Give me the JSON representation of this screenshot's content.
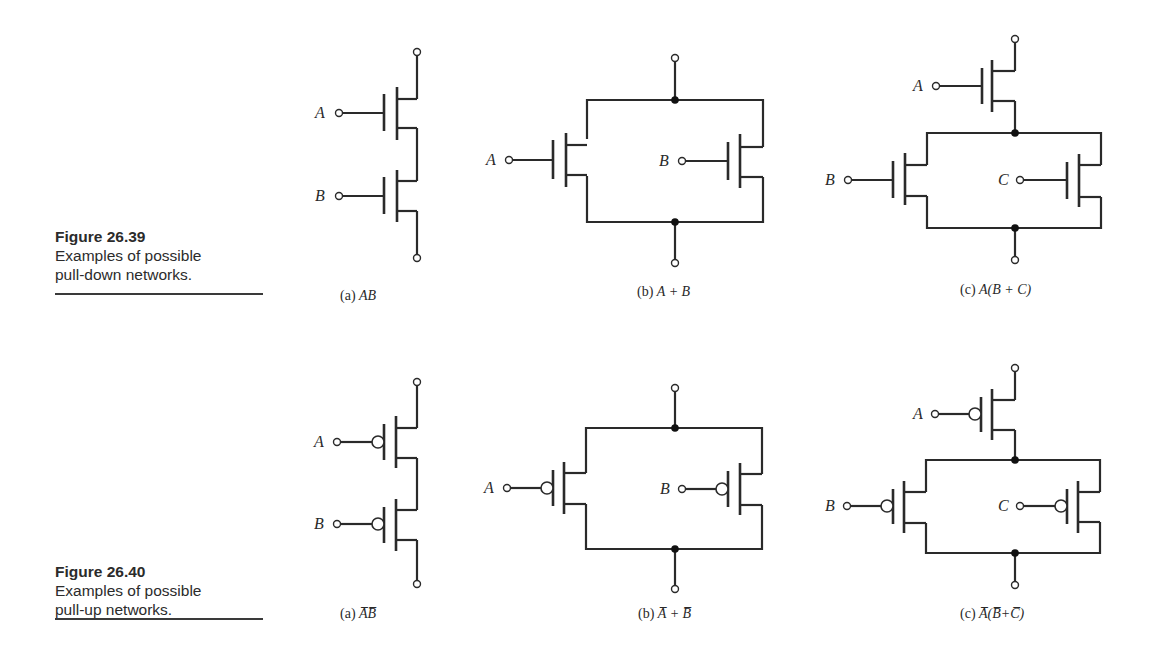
{
  "figures": [
    {
      "number": "Figure 26.39",
      "description_line1": "Examples of possible",
      "description_line2": "pull-down networks.",
      "transistor_type": "NMOS",
      "circuits": [
        {
          "id": "a",
          "prefix": "(a)",
          "expression": "AB",
          "inputs": [
            "A",
            "B"
          ],
          "topology": "series"
        },
        {
          "id": "b",
          "prefix": "(b)",
          "expression": "A + B",
          "inputs": [
            "A",
            "B"
          ],
          "topology": "parallel"
        },
        {
          "id": "c",
          "prefix": "(c)",
          "expression": "A(B + C)",
          "inputs": [
            "A",
            "B",
            "C"
          ],
          "topology": "series-parallel"
        }
      ]
    },
    {
      "number": "Figure 26.40",
      "description_line1": "Examples of possible",
      "description_line2": "pull-up networks.",
      "transistor_type": "PMOS",
      "circuits": [
        {
          "id": "a",
          "prefix": "(a)",
          "expression": "A̅B̅",
          "inputs": [
            "A",
            "B"
          ],
          "topology": "series"
        },
        {
          "id": "b",
          "prefix": "(b)",
          "expression": "A̅ + B̅",
          "inputs": [
            "A",
            "B"
          ],
          "topology": "parallel"
        },
        {
          "id": "c",
          "prefix": "(c)",
          "expression": "A̅(B̅+C̅)",
          "inputs": [
            "A",
            "B",
            "C"
          ],
          "topology": "series-parallel"
        }
      ]
    }
  ],
  "labels": {
    "A": "A",
    "B": "B",
    "C": "C"
  },
  "colors": {
    "ink": "#2a2a2a",
    "caption": "#2b2b2b",
    "background": "#ffffff"
  }
}
